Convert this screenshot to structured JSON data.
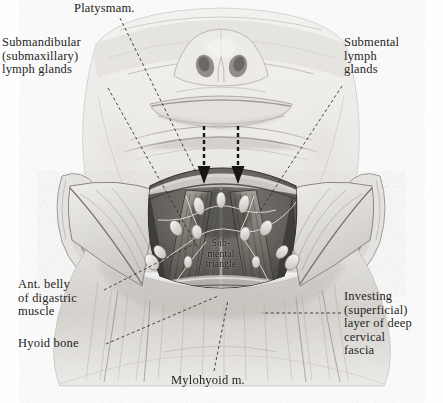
{
  "plate": {
    "title": "Submental triangle dissection",
    "view": "anterior-inferior view of head and neck",
    "background_color": "#fefefe",
    "ink_color": "#262421"
  },
  "labels": {
    "platysma": "Platysmam.",
    "submandibular": "Submandibular\n(submaxillary)\nlymph glands",
    "submental_glands": "Submental\nlymph\nglands",
    "digastric": "Ant. belly\nof digastric\nmuscle",
    "hyoid": "Hyoid bone",
    "investing": "Investing\n(superficial)\nlayer of deep\ncervical\nfascia",
    "mylohyoid": "Mylohyoid m.",
    "submental_triangle": "Sub-\nmental\ntriangle"
  },
  "leaders": [
    {
      "name": "platysma-leader",
      "style": "dashed",
      "from": [
        120,
        16
      ],
      "to": [
        196,
        170
      ]
    },
    {
      "name": "submandibular-leader",
      "style": "dashed",
      "from": [
        108,
        88
      ],
      "to": [
        196,
        246
      ]
    },
    {
      "name": "submental-glands-leader",
      "style": "dashed",
      "from": [
        344,
        86
      ],
      "to": [
        258,
        214
      ]
    },
    {
      "name": "digastric-leader",
      "style": "dashed",
      "from": [
        104,
        290
      ],
      "to": [
        196,
        243
      ]
    },
    {
      "name": "hyoid-leader",
      "style": "dashed",
      "from": [
        106,
        344
      ],
      "to": [
        217,
        296
      ]
    },
    {
      "name": "investing-leader",
      "style": "dashed",
      "from": [
        342,
        313
      ],
      "to": [
        262,
        313
      ]
    },
    {
      "name": "mylohyoid-leader",
      "style": "dashed",
      "from": [
        214,
        372
      ],
      "to": [
        228,
        300
      ]
    }
  ],
  "arrows": [
    {
      "name": "retraction-arrow-left",
      "x": 204,
      "y_top": 126,
      "y_tip": 182
    },
    {
      "name": "retraction-arrow-right",
      "x": 238,
      "y_top": 126,
      "y_tip": 182
    }
  ],
  "anatomy": {
    "structures": [
      "head viewed from below",
      "nose with nostrils",
      "lower lip and chin",
      "left auricle",
      "right auricle",
      "reflected skin flaps",
      "mylohyoid muscle",
      "anterior bellies of digastric muscles",
      "submental lymph nodes",
      "submandibular lymph nodes",
      "investing layer of deep cervical fascia",
      "hyoid bone",
      "platysma muscle"
    ],
    "medium": "graphite pencil halftone engraving",
    "tone_range": [
      "#f4f2ef",
      "#8f8b86",
      "#2b2926"
    ]
  }
}
